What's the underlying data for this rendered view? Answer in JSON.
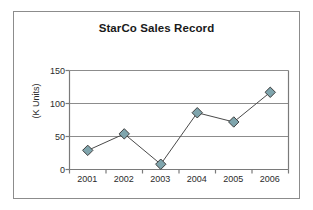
{
  "chart_data": {
    "type": "line",
    "title": "StarCo Sales Record",
    "xlabel": "",
    "ylabel": "(K Units)",
    "categories": [
      "2001",
      "2002",
      "2003",
      "2004",
      "2005",
      "2006"
    ],
    "values": [
      29,
      54,
      8,
      86,
      72,
      117
    ],
    "series": [
      {
        "name": "StarCo Sales",
        "values": [
          29,
          54,
          8,
          86,
          72,
          117
        ]
      }
    ],
    "ylim": [
      0,
      150
    ],
    "yticks": [
      0,
      50,
      100,
      150
    ],
    "ytick_labels": [
      "0",
      "50",
      "100",
      "150"
    ],
    "xtick_labels": [
      "2001",
      "2002",
      "2003",
      "2004",
      "2005",
      "2006"
    ],
    "grid": "horizontal",
    "legend": "none",
    "marker": "diamond",
    "marker_fill": "#7fa5ad",
    "marker_edge": "#3f3f3f",
    "line_color": "#4a4a4a",
    "axis_color": "#7a7a7a",
    "grid_color": "#8c8c8c",
    "frame_color": "#8c8c8c",
    "background": "#ffffff",
    "title_color": "#1a1a1a",
    "tick_label_color": "#2b2b2b"
  }
}
